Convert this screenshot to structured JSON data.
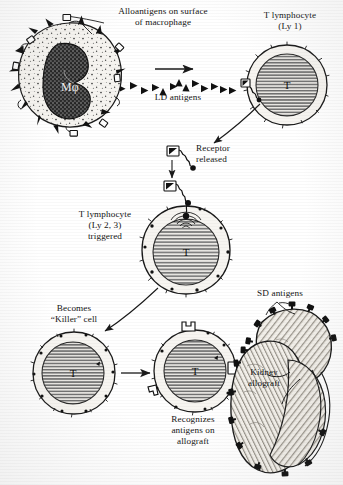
{
  "figure": {
    "type": "biological-process-diagram"
  },
  "labels": {
    "alloantigens": "Alloantigens on surface\nof macrophage",
    "t_lymphocyte_ly1": "T lymphocyte\n(Ly 1)",
    "ld_antigens": "LD antigens",
    "receptor_released": "Receptor\nreleased",
    "t_lymphocyte_ly23": "T lymphocyte\n(Ly 2, 3)\ntriggered",
    "becomes_killer": "Becomes\n“Killer” cell",
    "recognizes": "Recognizes\nantigens on\nallograft",
    "sd_antigens": "SD antigens",
    "kidney_allograft": "Kidney\nallograft"
  },
  "cells": {
    "macrophage": {
      "name": "macrophage",
      "nucleus_label": "Mφ",
      "surface_markers": [
        "black-triangle-spike",
        "open-square-receptor"
      ]
    },
    "t_cell_ly1": {
      "name": "t-lymphocyte-ly1",
      "nucleus_label": "T"
    },
    "t_cell_triggered": {
      "name": "t-lymphocyte-triggered",
      "nucleus_label": "T"
    },
    "killer_cell": {
      "name": "killer-cell",
      "nucleus_label": "T"
    },
    "recognizing_cell": {
      "name": "recognizing-killer-cell",
      "nucleus_label": "T"
    }
  },
  "organ": {
    "name": "kidney-allograft",
    "antigen_marker": "SD antigen"
  },
  "colors": {
    "ink": "#1a1a1a",
    "paper": "#ffffff",
    "nucleus_dark": "#4a4a4a",
    "nucleus_hatch": "#8a8a8a",
    "cytoplasm": "#f4f2ee",
    "organ_fill": "#efece6"
  }
}
